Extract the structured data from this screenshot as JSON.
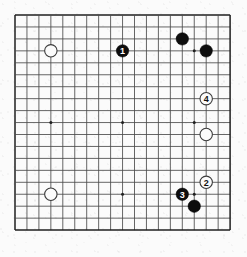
{
  "figure": {
    "type": "go-board-diagram",
    "board_size": 19,
    "colors": {
      "background": "#fbfbfb",
      "grid_line": "#4a4a4a",
      "board_border": "#1f1f1f",
      "black_stone": "#0d0d0d",
      "white_stone": "#fbfbfb",
      "white_stone_outline": "#3a3a3a",
      "label_on_black": "#ffffff",
      "label_on_white": "#111111"
    }
  },
  "geometry": {
    "origin_x": 15,
    "origin_y": 15,
    "spacing": 11.95,
    "stone_radius": 6.2,
    "hoshi_radius": 1.5,
    "lines": 19
  },
  "hoshi_points": [
    {
      "col": 4,
      "row": 4
    },
    {
      "col": 10,
      "row": 4
    },
    {
      "col": 16,
      "row": 4
    },
    {
      "col": 4,
      "row": 10
    },
    {
      "col": 10,
      "row": 10
    },
    {
      "col": 16,
      "row": 10
    },
    {
      "col": 4,
      "row": 16
    },
    {
      "col": 10,
      "row": 16
    },
    {
      "col": 16,
      "row": 16
    }
  ],
  "stones": [
    {
      "id": "white-upper-left",
      "color": "white",
      "col": 4,
      "row": 4,
      "label": ""
    },
    {
      "id": "black-move-1",
      "color": "black",
      "col": 10,
      "row": 4,
      "label": "1"
    },
    {
      "id": "black-upper-right-high",
      "color": "black",
      "col": 15,
      "row": 3,
      "label": ""
    },
    {
      "id": "black-upper-right-star",
      "color": "black",
      "col": 17,
      "row": 4,
      "label": ""
    },
    {
      "id": "white-move-4",
      "color": "white",
      "col": 17,
      "row": 8,
      "label": "4"
    },
    {
      "id": "white-right-side",
      "color": "white",
      "col": 17,
      "row": 11,
      "label": ""
    },
    {
      "id": "white-move-2",
      "color": "white",
      "col": 17,
      "row": 15,
      "label": "2"
    },
    {
      "id": "black-move-3",
      "color": "black",
      "col": 15,
      "row": 16,
      "label": "3"
    },
    {
      "id": "black-lower-right",
      "color": "black",
      "col": 16,
      "row": 17,
      "label": ""
    },
    {
      "id": "white-lower-left",
      "color": "white",
      "col": 4,
      "row": 16,
      "label": ""
    }
  ],
  "move_sequence": [
    {
      "number": "1",
      "color": "black"
    },
    {
      "number": "2",
      "color": "white"
    },
    {
      "number": "3",
      "color": "black"
    },
    {
      "number": "4",
      "color": "white"
    }
  ]
}
